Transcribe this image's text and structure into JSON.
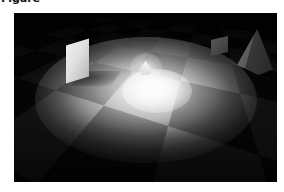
{
  "caption": {
    "text": "Figure"
  },
  "figure": {
    "alt": "ray-traced checkerboard floor lit by a single spotlight",
    "scene_type": "3d-render",
    "frame": {
      "x": 14,
      "y": 13,
      "width": 263,
      "height": 169
    },
    "colors": {
      "background": "#ffffff",
      "floor_light_tile": "#9a9a9a",
      "floor_dark_tile": "#2e2e2e",
      "ambient_shadow": "#2b2b2b",
      "light_highlight": "#ffffff",
      "panel_face": "#e2e2e2",
      "pyramid_lit_face": "#6d6d6d",
      "pyramid_dark_face": "#262626"
    },
    "objects": [
      {
        "name": "checkerboard-floor",
        "label": "Checkerboard floor",
        "description": "Tiled plane in perspective receding to the horizon"
      },
      {
        "name": "light-pool",
        "label": "Spotlight pool",
        "description": "Elliptical region of illumination centred on the floor"
      },
      {
        "name": "light-core",
        "label": "Light hotspot",
        "description": "Saturated white core where the lamp is brightest"
      },
      {
        "name": "emitter",
        "label": "Emitter object",
        "description": "Small faceted light-emitting body at the pool centre"
      },
      {
        "name": "white-panel",
        "label": "White panel",
        "description": "Upright diffuse card standing left of centre"
      },
      {
        "name": "pyramid",
        "label": "Pyramid",
        "description": "Dark four-sided pyramid at the right edge"
      },
      {
        "name": "block",
        "label": "Small block",
        "description": "Low dark box behind the pyramid"
      }
    ]
  }
}
